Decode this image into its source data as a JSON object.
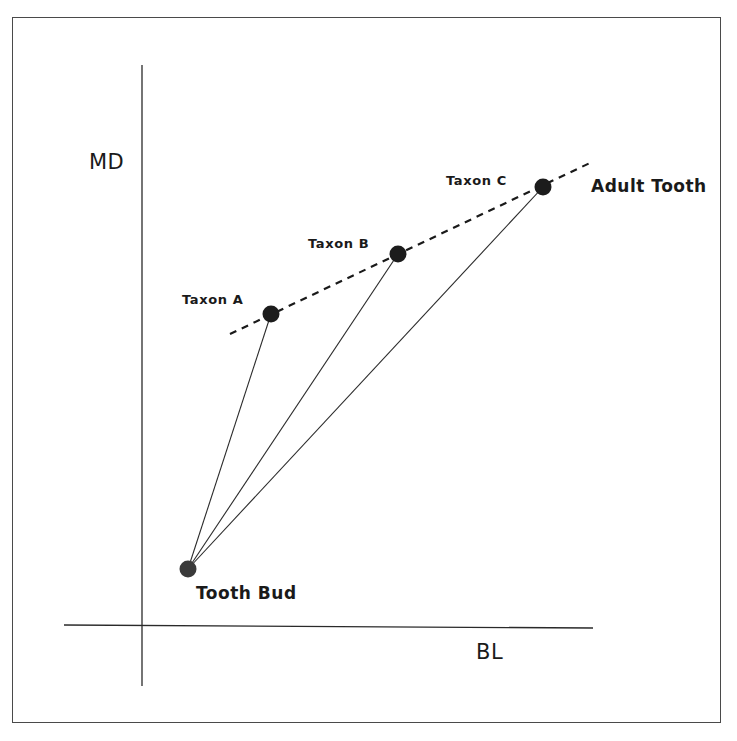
{
  "diagram": {
    "type": "growth-trajectory",
    "axes": {
      "y_label": "MD",
      "x_label": "BL"
    },
    "points": {
      "tooth_bud": {
        "label": "Tooth Bud",
        "x": 188,
        "y": 569,
        "color": "#3a3a3a"
      },
      "taxon_a": {
        "label": "Taxon A",
        "x": 271,
        "y": 314,
        "color": "#1c1c1c"
      },
      "taxon_b": {
        "label": "Taxon B",
        "x": 398,
        "y": 254,
        "color": "#1c1c1c"
      },
      "taxon_c": {
        "label": "Taxon C",
        "x": 543,
        "y": 187,
        "color": "#1c1c1c"
      }
    },
    "annotations": {
      "adult_tooth": "Adult Tooth"
    },
    "trend_line": {
      "style": "dashed",
      "from": [
        230,
        334
      ],
      "to": [
        592,
        162
      ]
    },
    "connectors": [
      {
        "from": "tooth_bud",
        "to": "taxon_a"
      },
      {
        "from": "tooth_bud",
        "to": "taxon_b"
      },
      {
        "from": "tooth_bud",
        "to": "taxon_c"
      }
    ],
    "colors": {
      "ink": "#1a1a1a",
      "frame": "#4a4a4a",
      "background": "#ffffff"
    }
  }
}
